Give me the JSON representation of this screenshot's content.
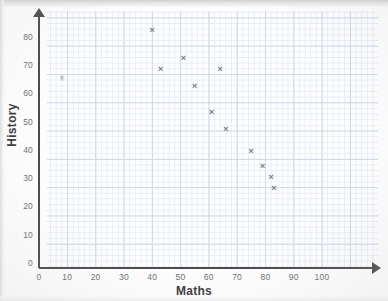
{
  "chart_data": {
    "type": "scatter",
    "title": "",
    "xlabel": "Maths",
    "ylabel": "History",
    "xlim": [
      0,
      110
    ],
    "ylim": [
      0,
      88
    ],
    "xticks": [
      0,
      10,
      20,
      30,
      40,
      50,
      60,
      70,
      80,
      90,
      100
    ],
    "yticks": [
      0,
      10,
      20,
      30,
      40,
      50,
      60,
      70,
      80
    ],
    "grid": true,
    "grid_style": "graph-paper",
    "legend": "none",
    "marker": "x",
    "marker_color": "#7b7b7b",
    "points": [
      {
        "x": 40,
        "y": 84
      },
      {
        "x": 43,
        "y": 70
      },
      {
        "x": 51,
        "y": 74
      },
      {
        "x": 55,
        "y": 64
      },
      {
        "x": 61,
        "y": 55
      },
      {
        "x": 64,
        "y": 70
      },
      {
        "x": 66,
        "y": 49
      },
      {
        "x": 75,
        "y": 41
      },
      {
        "x": 79,
        "y": 36
      },
      {
        "x": 82,
        "y": 32
      },
      {
        "x": 83,
        "y": 28
      }
    ],
    "annotations": [
      {
        "kind": "smudge",
        "x": 8,
        "y": 67
      }
    ]
  },
  "axes": {
    "x_title": "Maths",
    "y_title": "History",
    "x_tick_labels": [
      "0",
      "10",
      "20",
      "30",
      "40",
      "50",
      "60",
      "70",
      "80",
      "90",
      "100"
    ],
    "y_tick_labels": [
      "0",
      "10",
      "20",
      "30",
      "40",
      "50",
      "60",
      "70",
      "80"
    ],
    "axis_color": "#4a4a4a",
    "grid_major_color": "#c3d4e6",
    "grid_minor_color": "#e2ecf5"
  }
}
